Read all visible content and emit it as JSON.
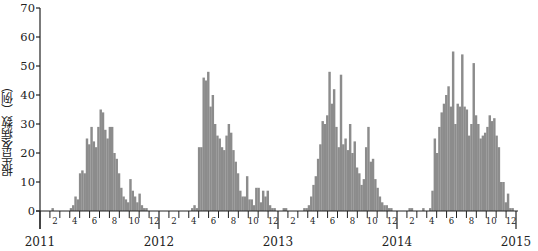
{
  "chart_data": {
    "type": "bar",
    "title": "",
    "xlabel": "",
    "ylabel": "报告发病数（例）",
    "ylim": [
      0,
      70
    ],
    "yticks": [
      0,
      10,
      20,
      30,
      40,
      50,
      60,
      70
    ],
    "grid": false,
    "legend": null,
    "bar_color": "#8c8c8c",
    "x_unit": "week",
    "year_labels": [
      "2011",
      "2012",
      "2013",
      "2014",
      "2015"
    ],
    "month_tick_labels": [
      "2",
      "4",
      "6",
      "8",
      "10",
      "12"
    ],
    "series": [
      {
        "name": "weekly reported cases",
        "year": "2011",
        "values": [
          0,
          0,
          0,
          0,
          0,
          1,
          0,
          0,
          0,
          0,
          0,
          0,
          0,
          1,
          2,
          5,
          4,
          13,
          14,
          13,
          25,
          23,
          29,
          24,
          22,
          29,
          35,
          34,
          28,
          25,
          29,
          29,
          20,
          18,
          13,
          8,
          5,
          4,
          3,
          11,
          7,
          5,
          3,
          6,
          2,
          1,
          1,
          0,
          0,
          0,
          0,
          0
        ]
      },
      {
        "name": "weekly reported cases",
        "year": "2012",
        "values": [
          0,
          0,
          0,
          0,
          0,
          0,
          0,
          0,
          0,
          0,
          0,
          0,
          0,
          0,
          1,
          2,
          1,
          22,
          22,
          46,
          45,
          48,
          36,
          40,
          30,
          26,
          25,
          22,
          21,
          26,
          30,
          27,
          21,
          17,
          13,
          7,
          5,
          5,
          12,
          4,
          4,
          2,
          8,
          8,
          3,
          7,
          5,
          7,
          2,
          1,
          1,
          0
        ]
      },
      {
        "name": "weekly reported cases",
        "year": "2013",
        "values": [
          0,
          0,
          1,
          1,
          0,
          0,
          0,
          0,
          0,
          0,
          0,
          1,
          1,
          2,
          5,
          9,
          12,
          18,
          23,
          31,
          30,
          33,
          48,
          37,
          42,
          29,
          22,
          47,
          23,
          25,
          21,
          30,
          20,
          24,
          15,
          13,
          9,
          11,
          22,
          29,
          17,
          18,
          11,
          8,
          5,
          3,
          2,
          2,
          1,
          1,
          0,
          0
        ]
      },
      {
        "name": "weekly reported cases",
        "year": "2014",
        "values": [
          0,
          0,
          0,
          0,
          0,
          1,
          1,
          0,
          0,
          0,
          0,
          1,
          0,
          0,
          1,
          7,
          25,
          20,
          29,
          34,
          37,
          40,
          43,
          36,
          55,
          30,
          37,
          36,
          54,
          36,
          35,
          26,
          30,
          51,
          33,
          30,
          25,
          26,
          27,
          29,
          33,
          31,
          32,
          26,
          22,
          10,
          10,
          3,
          6,
          1,
          1,
          0
        ]
      }
    ]
  },
  "axis": {
    "y_tick_labels": [
      "0",
      "10",
      "20",
      "30",
      "40",
      "50",
      "60",
      "70"
    ],
    "year_labels": [
      "2011",
      "2012",
      "2013",
      "2014",
      "2015"
    ],
    "month_labels": [
      "2",
      "4",
      "6",
      "8",
      "10",
      "12"
    ]
  },
  "ylabel": "报告发病数（例）"
}
